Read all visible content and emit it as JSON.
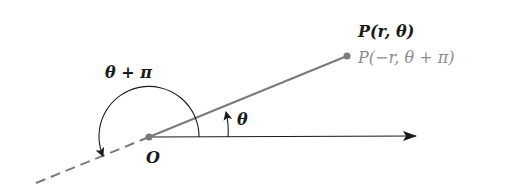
{
  "diagram": {
    "labels": {
      "point_primary": "P(r, θ)",
      "point_equivalent": "P(−r, θ + π)",
      "angle_large": "θ + π",
      "angle_small": "θ",
      "origin": "O"
    },
    "colors": {
      "ray": "#7a7a7a",
      "axis": "#1a1a1a",
      "text_primary": "#1a1a1a",
      "text_secondary": "#8c8c8c"
    },
    "geometry": {
      "origin": [
        149,
        137
      ],
      "point": [
        347,
        56
      ],
      "polar_axis_end": [
        416,
        136
      ],
      "dashed_end": [
        36,
        183
      ],
      "large_arc_radius": 50,
      "small_arc_radius": 79
    }
  }
}
